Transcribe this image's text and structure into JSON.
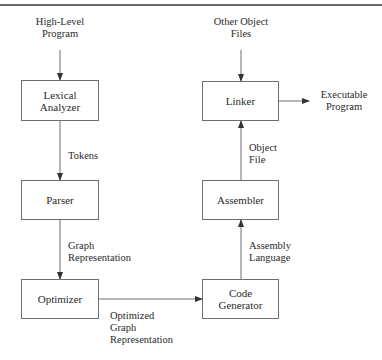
{
  "diagram": {
    "nodes": {
      "lexical_analyzer": {
        "line1": "Lexical",
        "line2": "Analyzer"
      },
      "parser": {
        "line1": "Parser"
      },
      "optimizer": {
        "line1": "Optimizer"
      },
      "code_generator": {
        "line1": "Code",
        "line2": "Generator"
      },
      "assembler": {
        "line1": "Assembler"
      },
      "linker": {
        "line1": "Linker"
      }
    },
    "inputs": {
      "high_level_program": {
        "line1": "High-Level",
        "line2": "Program"
      },
      "other_object_files": {
        "line1": "Other Object",
        "line2": "Files"
      }
    },
    "outputs": {
      "executable_program": {
        "line1": "Executable",
        "line2": "Program"
      }
    },
    "edges": {
      "tokens": {
        "line1": "Tokens"
      },
      "graph_representation": {
        "line1": "Graph",
        "line2": "Representation"
      },
      "optimized_graph_representation": {
        "line1": "Optimized",
        "line2": "Graph",
        "line3": "Representation"
      },
      "assembly_language": {
        "line1": "Assembly",
        "line2": "Language"
      },
      "object_file": {
        "line1": "Object",
        "line2": "File"
      }
    },
    "colors": {
      "line": "#6e6e6e",
      "text": "#2a2a2a",
      "rule": "#6a6a6a"
    }
  }
}
